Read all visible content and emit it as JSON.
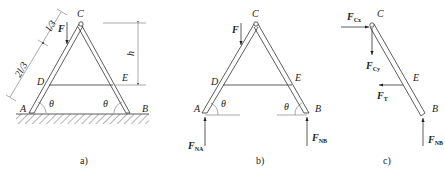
{
  "figures": [
    {
      "id": "a",
      "caption": "a)",
      "points": {
        "A": "A",
        "B": "B",
        "C": "C",
        "D": "D",
        "E": "E"
      },
      "force": "F",
      "angle": "θ",
      "dims": {
        "upper": "l/3",
        "lower": "2l/3",
        "height": "h"
      }
    },
    {
      "id": "b",
      "caption": "b)",
      "points": {
        "A": "A",
        "B": "B",
        "C": "C",
        "D": "D",
        "E": "E"
      },
      "force": "F",
      "angle": "θ",
      "reactions": {
        "A": {
          "main": "F",
          "sub": "NA"
        },
        "B": {
          "main": "F",
          "sub": "NB"
        }
      }
    },
    {
      "id": "c",
      "caption": "c)",
      "points": {
        "C": "C",
        "E": "E",
        "B": "B"
      },
      "forces": {
        "Cx": {
          "main": "F",
          "sub": "Cx"
        },
        "Cy": {
          "main": "F",
          "sub": "Cy"
        },
        "T": {
          "main": "F",
          "sub": "T"
        },
        "NB": {
          "main": "F",
          "sub": "NB"
        }
      }
    }
  ]
}
